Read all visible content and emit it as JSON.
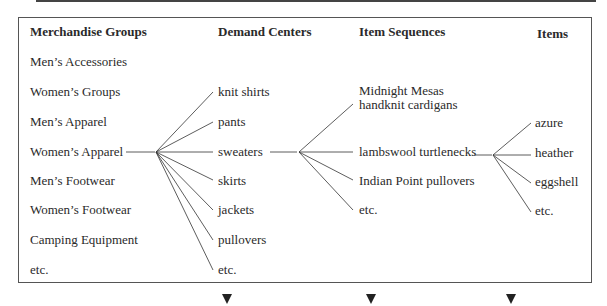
{
  "headers": {
    "groups": "Merchandise Groups",
    "centers": "Demand Centers",
    "sequences": "Item Sequences",
    "items": "Items"
  },
  "groups": [
    "Men’s Accessories",
    "Women’s Groups",
    "Men’s Apparel",
    "Women’s Apparel",
    "Men’s Footwear",
    "Women’s Footwear",
    "Camping Equipment",
    "etc."
  ],
  "centers": [
    "knit shirts",
    "pants",
    "sweaters",
    "skirts",
    "jackets",
    "pullovers",
    "etc."
  ],
  "sequences": [
    "Midnight Mesas",
    "handknit cardigans",
    "lambswool turtlenecks",
    "Indian Point pullovers",
    "etc."
  ],
  "items": [
    "azure",
    "heather",
    "eggshell",
    "etc."
  ],
  "colors": {
    "line": "#333333",
    "text": "#2a2a2a",
    "arrow": "#222222"
  }
}
